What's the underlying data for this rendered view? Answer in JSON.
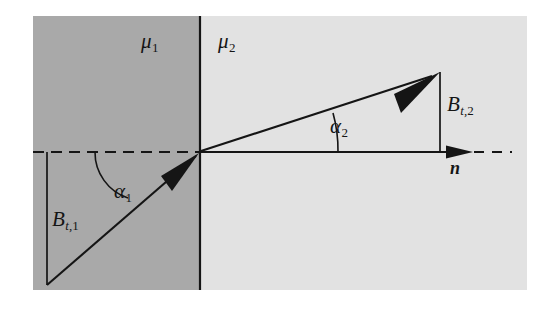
{
  "figure": {
    "name": "magnetic-field-refraction-at-interface",
    "canvas": {
      "width": 560,
      "height": 309
    },
    "background_color": "#ffffff"
  },
  "regions": {
    "medium_1": {
      "label_base": "μ",
      "label_sub": "1",
      "fill_color": "#a9a9a9",
      "side": "left"
    },
    "medium_2": {
      "label_base": "μ",
      "label_sub": "2",
      "fill_color": "#e2e2e2",
      "side": "right"
    }
  },
  "angles": {
    "alpha_1": {
      "base": "α",
      "sub": "1"
    },
    "alpha_2": {
      "base": "α",
      "sub": "2"
    }
  },
  "components": {
    "bt1": {
      "base": "B",
      "sub_italic": "t",
      "sub_comma": ",",
      "sub_num": "1"
    },
    "bt2": {
      "base": "B",
      "sub_italic": "t",
      "sub_comma": ",",
      "sub_num": "2"
    }
  },
  "normal_vector": {
    "label": "n"
  },
  "colors": {
    "line": "#151515",
    "interface": "#151515",
    "medium_1_fill": "#a9a9a9",
    "medium_2_fill": "#e2e2e2",
    "text": "#151515"
  }
}
